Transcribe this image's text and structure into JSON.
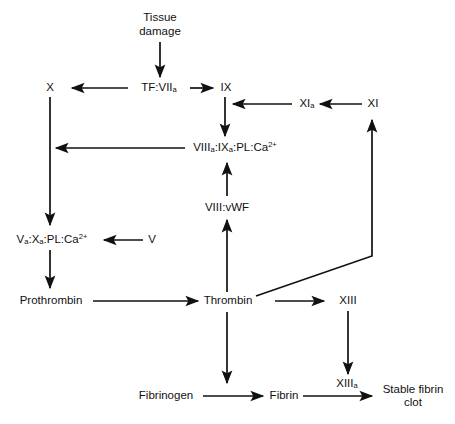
{
  "diagram": {
    "background_color": "#ffffff",
    "line_color": "#111111",
    "text_color": "#111111",
    "nodes": {
      "tissue_damage_line1": "Tissue",
      "tissue_damage_line2": "damage",
      "factor_x": "X",
      "tf_viia_main": "TF:VII",
      "tf_viia_sub": "a",
      "factor_ix_main": "IX",
      "factor_xia_main": "XI",
      "factor_xia_sub": "a",
      "factor_xi": "XI",
      "tenase_p1": "VIII",
      "tenase_s1": "a",
      "tenase_p2": ":IX",
      "tenase_s2": "a",
      "tenase_p3": ":PL:Ca",
      "tenase_sup": "2+",
      "viii_vwf": "VIII:vWF",
      "prothrombinase_p1": "V",
      "prothrombinase_s1": "a",
      "prothrombinase_p2": ":X",
      "prothrombinase_s2": "a",
      "prothrombinase_p3": ":PL:Ca",
      "prothrombinase_sup": "2+",
      "factor_v": "V",
      "prothrombin": "Prothrombin",
      "thrombin": "Thrombin",
      "factor_xiii": "XIII",
      "factor_xiiia_main": "XIII",
      "factor_xiiia_sub": "a",
      "fibrinogen": "Fibrinogen",
      "fibrin": "Fibrin",
      "stable_clot_line1": "Stable fibrin",
      "stable_clot_line2": "clot"
    },
    "edges": [
      {
        "name": "tissue-damage-to-tf-viia",
        "from": "Tissue damage",
        "to": "TF:VIIa"
      },
      {
        "name": "tf-viia-to-x",
        "from": "TF:VIIa",
        "to": "X"
      },
      {
        "name": "tf-viia-to-ix",
        "from": "TF:VIIa",
        "to": "IX"
      },
      {
        "name": "ix-to-tenase",
        "from": "IX",
        "to": "VIIIa:IXa:PL:Ca2+"
      },
      {
        "name": "xia-to-ix",
        "from": "XIa",
        "to": "IX"
      },
      {
        "name": "xi-to-xia",
        "from": "XI",
        "to": "XIa"
      },
      {
        "name": "tenase-to-x-activation",
        "from": "VIIIa:IXa:PL:Ca2+",
        "to": "X activation"
      },
      {
        "name": "x-to-prothrombinase",
        "from": "X",
        "to": "Va:Xa:PL:Ca2+"
      },
      {
        "name": "v-to-prothrombinase",
        "from": "V",
        "to": "Va:Xa:PL:Ca2+"
      },
      {
        "name": "prothrombinase-to-prothrombin",
        "from": "Va:Xa:PL:Ca2+",
        "to": "Prothrombin"
      },
      {
        "name": "prothrombin-to-thrombin",
        "from": "Prothrombin",
        "to": "Thrombin"
      },
      {
        "name": "thrombin-to-viii-vwf",
        "from": "Thrombin",
        "to": "VIII:vWF"
      },
      {
        "name": "viii-vwf-to-tenase",
        "from": "VIII:vWF",
        "to": "VIIIa:IXa:PL:Ca2+"
      },
      {
        "name": "thrombin-to-xi",
        "from": "Thrombin",
        "to": "XI"
      },
      {
        "name": "thrombin-to-xiii",
        "from": "Thrombin",
        "to": "XIII"
      },
      {
        "name": "thrombin-to-fibrinogen-fibrin",
        "from": "Thrombin",
        "to": "Fibrinogen to Fibrin"
      },
      {
        "name": "xiii-to-xiiia",
        "from": "XIII",
        "to": "XIIIa"
      },
      {
        "name": "fibrinogen-to-fibrin",
        "from": "Fibrinogen",
        "to": "Fibrin"
      },
      {
        "name": "fibrin-to-stable-clot",
        "from": "Fibrin",
        "to": "Stable fibrin clot"
      }
    ]
  }
}
